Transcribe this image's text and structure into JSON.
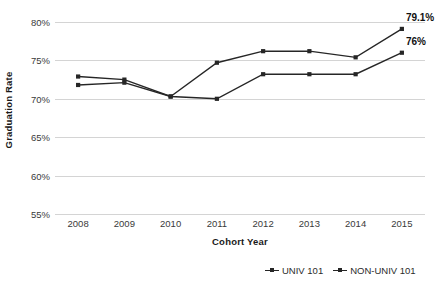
{
  "chart_data": {
    "type": "line",
    "title": "",
    "xlabel": "Cohort Year",
    "ylabel": "Graduation Rate",
    "categories": [
      "2008",
      "2009",
      "2010",
      "2011",
      "2012",
      "2013",
      "2014",
      "2015"
    ],
    "ylim": [
      55,
      80
    ],
    "ytick_labels": [
      "80%",
      "75%",
      "70%",
      "65%",
      "60%",
      "55%"
    ],
    "ytick_values": [
      80,
      75,
      70,
      65,
      60,
      55
    ],
    "grid": true,
    "legend_position": "bottom-right",
    "series": [
      {
        "name": "UNIV 101",
        "values": [
          72.9,
          72.5,
          70.3,
          74.7,
          76.2,
          76.2,
          75.4,
          79.1
        ],
        "end_label": "79.1%"
      },
      {
        "name": "NON-UNIV 101",
        "values": [
          71.8,
          72.1,
          70.3,
          70.0,
          73.2,
          73.2,
          73.2,
          76.0
        ],
        "end_label": "76%"
      }
    ],
    "annotations": [
      {
        "text": "79.1%",
        "series": "UNIV 101",
        "category": "2015"
      },
      {
        "text": "76%",
        "series": "NON-UNIV 101",
        "category": "2015"
      }
    ],
    "colors": {
      "line": "#262626",
      "grid": "#d4d4d4",
      "text": "#3a3a3a"
    }
  }
}
